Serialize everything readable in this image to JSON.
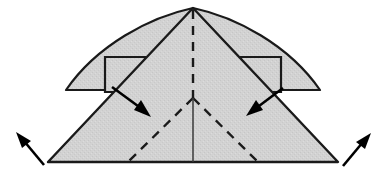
{
  "diagram": {
    "canvas": {
      "width": 382,
      "height": 187,
      "background": "#ffffff"
    },
    "style": {
      "paper_fill": "#d0d0d0",
      "outline_color": "#1a1a1a",
      "outline_width": 2.2,
      "fold_line_color": "#1a1a1a",
      "fold_line_width": 2.2,
      "fold_dash_pattern": "9 7",
      "arrow_color": "#000000"
    },
    "geometry": {
      "apex": {
        "x": 193,
        "y": 8
      },
      "base_left": {
        "x": 48,
        "y": 162
      },
      "base_right": {
        "x": 338,
        "y": 162
      },
      "wing_left_tip": {
        "x": 66,
        "y": 90
      },
      "wing_right_tip": {
        "x": 320,
        "y": 90
      },
      "fold_junction": {
        "x": 193,
        "y": 98
      }
    },
    "shapes": [
      {
        "name": "left-wing",
        "label": "Left curved wing flap",
        "path": "M 193 8 C 150 17, 97 45, 66 90 L 150 90 Z"
      },
      {
        "name": "right-wing",
        "label": "Right curved wing flap",
        "path": "M 193 8 C 236 17, 289 45, 320 90 L 236 90 Z"
      },
      {
        "name": "left-tab",
        "label": "Left rectangular tab",
        "path": "M 105 57 L 145 57 L 145 92 L 105 92 Z"
      },
      {
        "name": "right-tab",
        "label": "Right rectangular tab",
        "path": "M 241 57 L 281 57 L 281 92 L 241 92 Z"
      },
      {
        "name": "main-triangle",
        "label": "Main triangular body",
        "path": "M 193 8 L 338 162 L 48 162 Z"
      }
    ],
    "fold_lines": [
      {
        "name": "center-vertical-fold",
        "label": "Center vertical valley fold",
        "style": "dashed",
        "x1": 193,
        "y1": 10,
        "x2": 193,
        "y2": 98
      },
      {
        "name": "left-diagonal-fold",
        "label": "Left diagonal fold",
        "style": "dashed",
        "x1": 193,
        "y1": 98,
        "x2": 128,
        "y2": 162
      },
      {
        "name": "right-diagonal-fold",
        "label": "Right diagonal fold",
        "style": "dashed",
        "x1": 193,
        "y1": 98,
        "x2": 258,
        "y2": 162
      },
      {
        "name": "center-lower-crease",
        "label": "Center lower solid crease",
        "style": "solid",
        "x1": 193,
        "y1": 98,
        "x2": 193,
        "y2": 162
      }
    ],
    "arrows": [
      {
        "name": "arrow-inward-left",
        "label": "Push inward from upper left",
        "direction": "down-right",
        "from": {
          "x": 112,
          "y": 87
        },
        "to": {
          "x": 149,
          "y": 115
        }
      },
      {
        "name": "arrow-inward-right",
        "label": "Push inward from upper right",
        "direction": "down-left",
        "from": {
          "x": 283,
          "y": 88
        },
        "to": {
          "x": 248,
          "y": 114
        }
      },
      {
        "name": "arrow-outward-left",
        "label": "Pull outward to lower left",
        "direction": "up-left",
        "from": {
          "x": 44,
          "y": 165
        },
        "to": {
          "x": 17,
          "y": 133
        }
      },
      {
        "name": "arrow-outward-right",
        "label": "Pull outward to lower right",
        "direction": "up-right",
        "from": {
          "x": 343,
          "y": 166
        },
        "to": {
          "x": 370,
          "y": 134
        }
      }
    ]
  }
}
